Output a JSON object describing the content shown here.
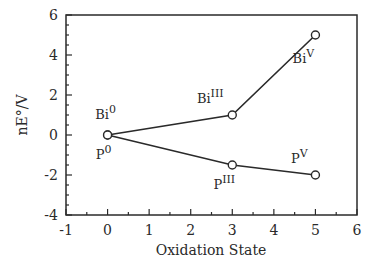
{
  "chart_data": {
    "type": "line",
    "title": "",
    "xlabel": "Oxidation State",
    "ylabel": "nE°/V",
    "xlim": [
      -1,
      6
    ],
    "ylim": [
      -4,
      6
    ],
    "xticks": [
      "-1",
      "0",
      "1",
      "2",
      "3",
      "4",
      "5",
      "6"
    ],
    "yticks": [
      "-4",
      "-2",
      "0",
      "2",
      "4",
      "6"
    ],
    "grid": false,
    "legend": null,
    "series": [
      {
        "name": "Bi",
        "x": [
          0,
          3,
          5
        ],
        "y": [
          0,
          1,
          5
        ],
        "point_labels": [
          {
            "base": "Bi",
            "sup": "0"
          },
          {
            "base": "Bi",
            "sup": "III"
          },
          {
            "base": "Bi",
            "sup": "V"
          }
        ]
      },
      {
        "name": "P",
        "x": [
          0,
          3,
          5
        ],
        "y": [
          0,
          -1.5,
          -2
        ],
        "point_labels": [
          {
            "base": "P",
            "sup": "0"
          },
          {
            "base": "P",
            "sup": "III"
          },
          {
            "base": "P",
            "sup": "V"
          }
        ]
      }
    ],
    "colors": {
      "line": "#2a2a2a",
      "marker_fill": "#ffffff",
      "axis": "#2a2a2a"
    }
  }
}
